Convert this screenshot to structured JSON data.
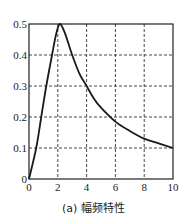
{
  "chart_data": {
    "type": "line",
    "title": "",
    "caption": "(a) 幅频特性",
    "xlabel": "",
    "ylabel": "",
    "xlim": [
      0,
      10
    ],
    "ylim": [
      0,
      0.5
    ],
    "grid": true,
    "grid_style": "dashed",
    "x_ticks": [
      0,
      2,
      4,
      6,
      8,
      10
    ],
    "y_ticks": [
      0,
      0.1,
      0.2,
      0.3,
      0.4,
      0.5
    ],
    "x_tick_labels": [
      "0",
      "2",
      "4",
      "6",
      "8",
      "10"
    ],
    "y_tick_labels": [
      "0",
      "0.1",
      "0.2",
      "0.3",
      "0.4",
      "0.5"
    ],
    "series": [
      {
        "name": "幅频特性",
        "color": "#1a1a1a",
        "x": [
          0,
          0.5,
          0.85,
          1.2,
          1.6,
          1.9,
          2.15,
          2.5,
          3.0,
          3.5,
          4.0,
          4.5,
          5.0,
          6.0,
          7.0,
          8.0,
          9.0,
          10.0
        ],
        "y": [
          0,
          0.1,
          0.2,
          0.3,
          0.4,
          0.47,
          0.5,
          0.47,
          0.4,
          0.34,
          0.3,
          0.26,
          0.23,
          0.185,
          0.155,
          0.13,
          0.115,
          0.1
        ]
      }
    ]
  },
  "caption": "(a) 幅频特性"
}
